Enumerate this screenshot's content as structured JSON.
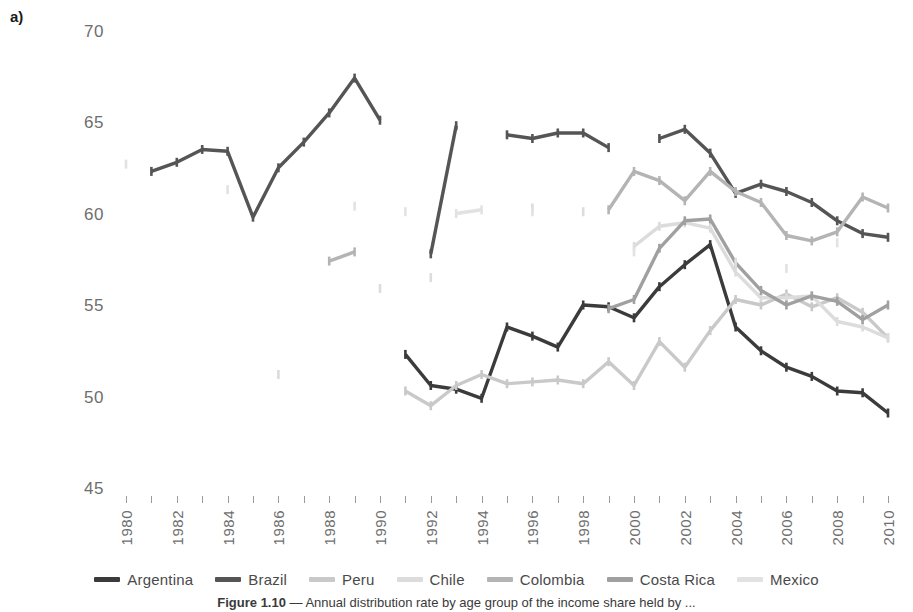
{
  "figure": {
    "panel_label": "a)",
    "caption_prefix": "Figure 1.10",
    "caption_text": " — Annual distribution rate by age group of the income share held by ..."
  },
  "chart_data": {
    "type": "line",
    "title": "",
    "xlabel": "",
    "ylabel": "",
    "xlim": [
      1980,
      2010
    ],
    "ylim": [
      45,
      70
    ],
    "yticks": [
      70,
      65,
      60,
      55,
      50,
      45
    ],
    "xticks": [
      1980,
      1982,
      1984,
      1986,
      1988,
      1990,
      1992,
      1994,
      1996,
      1998,
      2000,
      2002,
      2004,
      2006,
      2008,
      2010
    ],
    "x_all": [
      1980,
      1981,
      1982,
      1983,
      1984,
      1985,
      1986,
      1987,
      1988,
      1989,
      1990,
      1991,
      1992,
      1993,
      1994,
      1995,
      1996,
      1997,
      1998,
      1999,
      2000,
      2001,
      2002,
      2003,
      2004,
      2005,
      2006,
      2007,
      2008,
      2009,
      2010
    ],
    "grid": false,
    "legend_position": "bottom",
    "markers": "tick",
    "series": [
      {
        "name": "Argentina",
        "color": "#3b3b3b",
        "points": [
          {
            "x": 1991,
            "y": 52.3
          },
          {
            "x": 1992,
            "y": 50.6
          },
          {
            "x": 1993,
            "y": 50.4
          },
          {
            "x": 1994,
            "y": 49.9
          },
          {
            "x": 1995,
            "y": 53.8
          },
          {
            "x": 1996,
            "y": 53.3
          },
          {
            "x": 1997,
            "y": 52.7
          },
          {
            "x": 1998,
            "y": 55.0
          },
          {
            "x": 1999,
            "y": 54.9
          },
          {
            "x": 2000,
            "y": 54.3
          },
          {
            "x": 2001,
            "y": 56.0
          },
          {
            "x": 2002,
            "y": 57.2
          },
          {
            "x": 2003,
            "y": 58.3
          },
          {
            "x": 2004,
            "y": 53.8
          },
          {
            "x": 2005,
            "y": 52.5
          },
          {
            "x": 2006,
            "y": 51.6
          },
          {
            "x": 2007,
            "y": 51.1
          },
          {
            "x": 2008,
            "y": 50.3
          },
          {
            "x": 2009,
            "y": 50.2
          },
          {
            "x": 2010,
            "y": 49.1
          }
        ]
      },
      {
        "name": "Brazil",
        "color": "#555555",
        "points": [
          {
            "x": 1981,
            "y": 62.3
          },
          {
            "x": 1982,
            "y": 62.8
          },
          {
            "x": 1983,
            "y": 63.5
          },
          {
            "x": 1984,
            "y": 63.4
          },
          {
            "x": 1985,
            "y": 59.8
          },
          {
            "x": 1986,
            "y": 62.5
          },
          {
            "x": 1987,
            "y": 63.9
          },
          {
            "x": 1988,
            "y": 65.5
          },
          {
            "x": 1989,
            "y": 67.4
          },
          {
            "x": 1990,
            "y": 65.1
          },
          {
            "x": 1992,
            "y": 57.8
          },
          {
            "x": 1993,
            "y": 64.8
          },
          {
            "x": 1995,
            "y": 64.3
          },
          {
            "x": 1996,
            "y": 64.1
          },
          {
            "x": 1997,
            "y": 64.4
          },
          {
            "x": 1998,
            "y": 64.4
          },
          {
            "x": 1999,
            "y": 63.6
          },
          {
            "x": 2001,
            "y": 64.1
          },
          {
            "x": 2002,
            "y": 64.6
          },
          {
            "x": 2003,
            "y": 63.3
          },
          {
            "x": 2004,
            "y": 61.1
          },
          {
            "x": 2005,
            "y": 61.6
          },
          {
            "x": 2006,
            "y": 61.2
          },
          {
            "x": 2007,
            "y": 60.6
          },
          {
            "x": 2008,
            "y": 59.6
          },
          {
            "x": 2009,
            "y": 58.9
          },
          {
            "x": 2010,
            "y": 58.7
          }
        ]
      },
      {
        "name": "Peru",
        "color": "#c9c9c9",
        "points": [
          {
            "x": 1991,
            "y": 50.3
          },
          {
            "x": 1992,
            "y": 49.5
          },
          {
            "x": 1993,
            "y": 50.6
          },
          {
            "x": 1994,
            "y": 51.2
          },
          {
            "x": 1995,
            "y": 50.7
          },
          {
            "x": 1996,
            "y": 50.8
          },
          {
            "x": 1997,
            "y": 50.9
          },
          {
            "x": 1998,
            "y": 50.7
          },
          {
            "x": 1999,
            "y": 51.9
          },
          {
            "x": 2000,
            "y": 50.6
          },
          {
            "x": 2001,
            "y": 53.0
          },
          {
            "x": 2002,
            "y": 51.6
          },
          {
            "x": 2003,
            "y": 53.6
          },
          {
            "x": 2004,
            "y": 55.3
          },
          {
            "x": 2005,
            "y": 55.0
          },
          {
            "x": 2006,
            "y": 55.6
          },
          {
            "x": 2007,
            "y": 54.9
          },
          {
            "x": 2008,
            "y": 55.4
          },
          {
            "x": 2009,
            "y": 54.6
          },
          {
            "x": 2010,
            "y": 53.2
          }
        ]
      },
      {
        "name": "Chile",
        "color": "#dcdcdc",
        "points": [
          {
            "x": 1986,
            "y": 51.2
          },
          {
            "x": 1990,
            "y": 55.9
          },
          {
            "x": 1992,
            "y": 56.5
          },
          {
            "x": 1996,
            "y": 60.3
          },
          {
            "x": 1998,
            "y": 60.1
          },
          {
            "x": 2000,
            "y": 58.2
          },
          {
            "x": 2001,
            "y": 59.3
          },
          {
            "x": 2002,
            "y": 59.5
          },
          {
            "x": 2003,
            "y": 59.2
          },
          {
            "x": 2004,
            "y": 56.8
          },
          {
            "x": 2005,
            "y": 55.4
          },
          {
            "x": 2006,
            "y": 55.4
          },
          {
            "x": 2007,
            "y": 55.5
          },
          {
            "x": 2008,
            "y": 54.1
          },
          {
            "x": 2009,
            "y": 53.8
          },
          {
            "x": 2010,
            "y": 53.2
          }
        ]
      },
      {
        "name": "Colombia",
        "color": "#b4b4b4",
        "points": [
          {
            "x": 1988,
            "y": 57.4
          },
          {
            "x": 1989,
            "y": 57.9
          },
          {
            "x": 1999,
            "y": 60.2
          },
          {
            "x": 2000,
            "y": 62.3
          },
          {
            "x": 2001,
            "y": 61.8
          },
          {
            "x": 2002,
            "y": 60.7
          },
          {
            "x": 2003,
            "y": 62.3
          },
          {
            "x": 2004,
            "y": 61.2
          },
          {
            "x": 2005,
            "y": 60.6
          },
          {
            "x": 2006,
            "y": 58.8
          },
          {
            "x": 2007,
            "y": 58.5
          },
          {
            "x": 2008,
            "y": 59.0
          },
          {
            "x": 2009,
            "y": 60.9
          },
          {
            "x": 2010,
            "y": 60.3
          }
        ]
      },
      {
        "name": "Costa Rica",
        "color": "#a0a0a0",
        "points": [
          {
            "x": 1999,
            "y": 54.8
          },
          {
            "x": 2000,
            "y": 55.3
          },
          {
            "x": 2001,
            "y": 58.1
          },
          {
            "x": 2002,
            "y": 59.6
          },
          {
            "x": 2003,
            "y": 59.7
          },
          {
            "x": 2004,
            "y": 57.3
          },
          {
            "x": 2005,
            "y": 55.8
          },
          {
            "x": 2006,
            "y": 55.0
          },
          {
            "x": 2007,
            "y": 55.5
          },
          {
            "x": 2008,
            "y": 55.2
          },
          {
            "x": 2009,
            "y": 54.2
          },
          {
            "x": 2010,
            "y": 55.0
          }
        ]
      },
      {
        "name": "Mexico",
        "color": "#e2e2e2",
        "points": [
          {
            "x": 1980,
            "y": 62.7
          },
          {
            "x": 1984,
            "y": 61.3
          },
          {
            "x": 1989,
            "y": 60.4
          },
          {
            "x": 1991,
            "y": 60.1
          },
          {
            "x": 1993,
            "y": 60.0
          },
          {
            "x": 1994,
            "y": 60.2
          },
          {
            "x": 1996,
            "y": 60.1
          },
          {
            "x": 2000,
            "y": 57.9
          },
          {
            "x": 2004,
            "y": 57.3
          },
          {
            "x": 2006,
            "y": 57.0
          },
          {
            "x": 2008,
            "y": 58.4
          }
        ]
      }
    ]
  },
  "legend": {
    "items": [
      {
        "label": "Argentina",
        "color": "#3b3b3b"
      },
      {
        "label": "Brazil",
        "color": "#555555"
      },
      {
        "label": "Peru",
        "color": "#c9c9c9"
      },
      {
        "label": "Chile",
        "color": "#dcdcdc"
      },
      {
        "label": "Colombia",
        "color": "#b4b4b4"
      },
      {
        "label": "Costa Rica",
        "color": "#a0a0a0"
      },
      {
        "label": "Mexico",
        "color": "#e2e2e2"
      }
    ]
  }
}
